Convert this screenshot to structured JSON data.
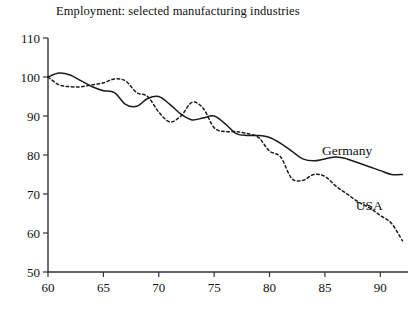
{
  "chart_data": {
    "type": "line",
    "title": "Employment: selected manufacturing industries",
    "xlabel": "",
    "ylabel": "",
    "xlim": [
      60,
      92.5
    ],
    "ylim": [
      50,
      110
    ],
    "grid": false,
    "legend_position": "inline-right",
    "y_ticks": [
      50,
      60,
      70,
      80,
      90,
      100,
      110
    ],
    "y_tick_labels": [
      "50",
      "60",
      "70",
      "80",
      "90",
      "100",
      "110"
    ],
    "x_ticks": [
      60,
      65,
      70,
      75,
      80,
      85,
      90
    ],
    "x_tick_labels": [
      "60",
      "65",
      "70",
      "75",
      "80",
      "85",
      "90"
    ],
    "x": [
      60,
      61,
      62,
      63,
      64,
      65,
      66,
      67,
      68,
      69,
      70,
      71,
      72,
      73,
      74,
      75,
      76,
      77,
      78,
      79,
      80,
      81,
      82,
      83,
      84,
      85,
      86,
      87,
      88,
      89,
      90,
      91,
      92
    ],
    "series": [
      {
        "name": "Germany",
        "style": "solid",
        "color": "#1a1a1a",
        "label": "Germany",
        "values": [
          100.0,
          101.0,
          100.5,
          99.0,
          97.5,
          96.5,
          96.0,
          93.0,
          92.5,
          94.5,
          95.0,
          93.0,
          90.5,
          89.0,
          89.5,
          90.0,
          88.0,
          85.5,
          85.0,
          85.0,
          84.5,
          83.0,
          81.0,
          79.0,
          78.5,
          79.0,
          79.5,
          79.0,
          78.0,
          77.0,
          76.0,
          75.0,
          75.0
        ]
      },
      {
        "name": "USA",
        "style": "dashed",
        "color": "#1a1a1a",
        "label": "USA",
        "values": [
          100.0,
          98.0,
          97.5,
          97.5,
          98.0,
          98.5,
          99.5,
          99.0,
          96.0,
          95.0,
          91.0,
          88.5,
          90.0,
          93.5,
          92.0,
          87.0,
          86.0,
          86.0,
          85.5,
          84.5,
          81.0,
          79.5,
          74.0,
          73.5,
          75.0,
          74.5,
          72.0,
          70.0,
          68.0,
          66.5,
          64.5,
          62.5,
          58.0
        ]
      }
    ],
    "annotations": [
      {
        "text": "Germany",
        "x": 87.0,
        "y": 80.0
      },
      {
        "text": "USA",
        "x": 89.0,
        "y": 66.0
      }
    ]
  },
  "geometry": {
    "plot_left": 48,
    "plot_right": 408,
    "plot_bottom": 272,
    "plot_top": 38
  }
}
